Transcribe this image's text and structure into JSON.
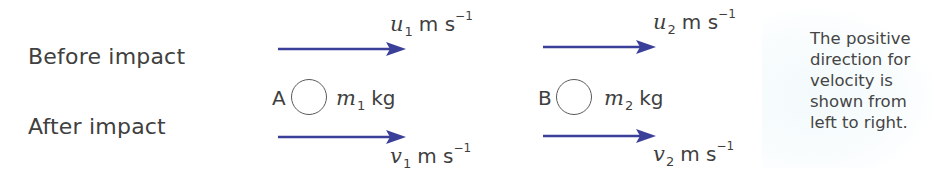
{
  "diagram": {
    "rows": {
      "before_label": "Before impact",
      "after_label": "After impact"
    },
    "arrow_color": "#3a3f9a",
    "particles": [
      {
        "letter": "A",
        "mass_var": "m",
        "mass_sub": "1",
        "mass_unit": "kg",
        "before_velocity": {
          "var": "u",
          "sub": "1",
          "unit": "m s",
          "exp": "−1"
        },
        "after_velocity": {
          "var": "v",
          "sub": "1",
          "unit": "m s",
          "exp": "−1"
        }
      },
      {
        "letter": "B",
        "mass_var": "m",
        "mass_sub": "2",
        "mass_unit": "kg",
        "before_velocity": {
          "var": "u",
          "sub": "2",
          "unit": "m s",
          "exp": "−1"
        },
        "after_velocity": {
          "var": "v",
          "sub": "2",
          "unit": "m s",
          "exp": "−1"
        }
      }
    ],
    "note": {
      "lines": [
        "The positive",
        "direction for",
        "velocity is",
        "shown from",
        "left to right."
      ]
    }
  }
}
